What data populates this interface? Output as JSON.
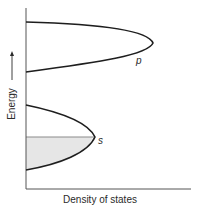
{
  "diagram": {
    "y_axis_label": "Energy",
    "y_axis_arrow": "arrow-up",
    "x_axis_label": "Density of states",
    "bands": [
      {
        "name": "p",
        "label": "p",
        "filled": false
      },
      {
        "name": "s",
        "label": "s",
        "filled": true,
        "fill_fraction_label": "occupied states up to Fermi level"
      }
    ],
    "colors": {
      "line": "#1e1e1e",
      "axis": "#555555",
      "fill": "#e6e6e6",
      "fermi_line": "#8a8a8a"
    }
  }
}
